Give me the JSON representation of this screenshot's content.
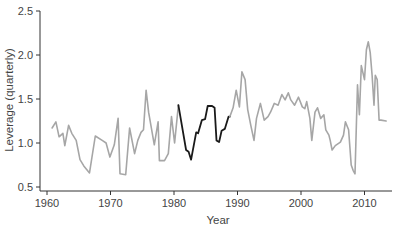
{
  "chart_data": {
    "type": "line",
    "title": "",
    "xlabel": "Year",
    "ylabel": "Leverage (quarterly)",
    "xlim": [
      1958.9,
      2014.1
    ],
    "ylim": [
      0.45,
      2.55
    ],
    "xticks": [
      1960,
      1970,
      1980,
      1990,
      2000,
      2010
    ],
    "xtick_labels": [
      "1960",
      "1970",
      "1980",
      "1990",
      "2000",
      "2010"
    ],
    "yticks": [
      0.5,
      1.0,
      1.5,
      2.0,
      2.5
    ],
    "ytick_labels": [
      "0.5",
      "1.0",
      "1.5",
      "2.0",
      "2.5"
    ],
    "grid": false,
    "legend": null,
    "colors": {
      "series": "#a6a6a6",
      "highlight": "#1a1a1a",
      "axis": "#333333"
    },
    "series": [
      {
        "name": "Leverage",
        "color": "#a6a6a6",
        "x": [
          1960.8,
          1961.4,
          1961.9,
          1962.5,
          1962.8,
          1963.4,
          1963.9,
          1964.6,
          1965.2,
          1965.8,
          1966.7,
          1967.6,
          1968.7,
          1969.3,
          1969.9,
          1970.6,
          1971.2,
          1971.5,
          1972.4,
          1973.0,
          1973.8,
          1974.3,
          1974.8,
          1975.2,
          1975.6,
          1976.0,
          1976.9,
          1977.5,
          1977.7,
          1978.5,
          1979.1,
          1979.6,
          1980.1,
          1980.7
        ],
        "y": [
          1.17,
          1.24,
          1.07,
          1.11,
          0.97,
          1.2,
          1.11,
          1.03,
          0.81,
          0.74,
          0.66,
          1.08,
          1.03,
          1.0,
          0.84,
          0.98,
          1.28,
          0.65,
          0.64,
          1.17,
          0.88,
          1.03,
          1.12,
          1.15,
          1.6,
          1.35,
          0.98,
          1.24,
          0.8,
          0.8,
          0.88,
          1.3,
          1.0,
          1.43
        ]
      },
      {
        "name": "Leverage (highlighted 1981–1989)",
        "color": "#1a1a1a",
        "x": [
          1980.7,
          1981.9,
          1982.3,
          1982.7,
          1983.5,
          1983.8,
          1984.4,
          1984.9,
          1985.3,
          1986.0,
          1986.4,
          1986.7,
          1987.1,
          1987.5,
          1988.0,
          1988.6,
          1988.8
        ],
        "y": [
          1.43,
          0.92,
          0.9,
          0.81,
          1.12,
          1.11,
          1.26,
          1.27,
          1.42,
          1.42,
          1.4,
          1.03,
          1.01,
          1.14,
          1.16,
          1.3,
          1.3
        ]
      },
      {
        "name": "Leverage",
        "color": "#a6a6a6",
        "x": [
          1988.8,
          1989.3,
          1989.8,
          1990.3,
          1990.7,
          1991.2,
          1991.6,
          1992.1,
          1992.6,
          1993.0,
          1993.6,
          1994.2,
          1994.8,
          1995.2,
          1995.8,
          1996.4,
          1997.0,
          1997.5,
          1998.0,
          1998.4,
          1999.0,
          1999.6,
          2000.2,
          2000.6,
          2000.9,
          2001.4,
          2001.7,
          2002.2,
          2002.6,
          2003.1,
          2003.6,
          2003.9,
          2004.4,
          2004.6,
          2004.9,
          2005.4,
          2006.2,
          2006.7,
          2007.0,
          2007.5,
          2007.9,
          2008.2,
          2008.5,
          2008.9,
          2009.2,
          2009.5,
          2010.0,
          2010.3,
          2010.6,
          2010.9,
          2011.2,
          2011.5,
          2011.7,
          2012.0,
          2012.3,
          2012.6,
          2013.4
        ],
        "y": [
          1.3,
          1.4,
          1.6,
          1.41,
          1.81,
          1.72,
          1.38,
          1.2,
          1.03,
          1.28,
          1.45,
          1.26,
          1.3,
          1.35,
          1.45,
          1.43,
          1.55,
          1.49,
          1.57,
          1.49,
          1.43,
          1.52,
          1.41,
          1.39,
          1.47,
          1.28,
          1.03,
          1.35,
          1.4,
          1.28,
          1.32,
          1.15,
          1.09,
          1.03,
          0.92,
          0.97,
          1.01,
          1.09,
          1.24,
          1.15,
          0.75,
          0.69,
          0.65,
          1.66,
          1.32,
          1.88,
          1.72,
          2.06,
          2.15,
          2.03,
          1.77,
          1.43,
          1.77,
          1.72,
          1.26,
          1.26,
          1.25
        ]
      }
    ]
  }
}
